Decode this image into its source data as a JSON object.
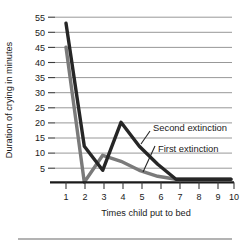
{
  "chart_data": {
    "type": "line",
    "title": "",
    "xlabel": "Times child put to bed",
    "ylabel": "Duration of crying in minutes",
    "x": [
      1,
      2,
      3,
      4,
      5,
      6,
      7,
      8,
      9,
      10
    ],
    "xticklabels": [
      "1",
      "2",
      "3",
      "4",
      "5",
      "6",
      "7",
      "8",
      "9",
      "10"
    ],
    "yticklabels": [
      "5",
      "10",
      "15",
      "20",
      "25",
      "30",
      "35",
      "40",
      "45",
      "50",
      "55"
    ],
    "yticks": [
      5,
      10,
      15,
      20,
      25,
      30,
      35,
      40,
      45,
      50,
      55
    ],
    "xlim": [
      1,
      10
    ],
    "ylim": [
      0,
      55
    ],
    "grid": true,
    "legend_position": "inline-annotations",
    "series": [
      {
        "name": "Second extinction",
        "color": "#262626",
        "values": [
          53,
          12,
          4,
          20,
          12,
          6,
          1,
          1,
          1,
          1
        ]
      },
      {
        "name": "First extinction",
        "color": "#7a7a7a",
        "values": [
          45,
          0,
          9,
          7,
          4,
          2,
          1,
          1,
          1,
          1
        ]
      }
    ],
    "annotations": [
      {
        "text": "Second extinction",
        "points_to_series": "Second extinction"
      },
      {
        "text": "First extinction",
        "points_to_series": "First extinction"
      }
    ]
  }
}
